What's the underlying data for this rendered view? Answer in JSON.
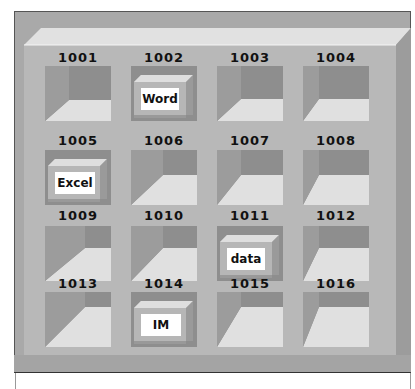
{
  "diagram": {
    "title": "",
    "colors": {
      "frame": "#a9a9a9",
      "face": "#b9b9b9",
      "bevel_top": "#e2e2e2",
      "right_face": "#9a9a9a",
      "cell_back": "#8f8f8f",
      "cell_left": "#9b9b9b",
      "cell_floor": "#e0e0e0",
      "drawer_face": "#b5b5b5",
      "drawer_top": "#dcdcdc",
      "drawer_label_bg": "#ffffff"
    },
    "cells": [
      {
        "id": "1001",
        "drawer": ""
      },
      {
        "id": "1002",
        "drawer": "Word"
      },
      {
        "id": "1003",
        "drawer": ""
      },
      {
        "id": "1004",
        "drawer": ""
      },
      {
        "id": "1005",
        "drawer": "Excel"
      },
      {
        "id": "1006",
        "drawer": ""
      },
      {
        "id": "1007",
        "drawer": ""
      },
      {
        "id": "1008",
        "drawer": ""
      },
      {
        "id": "1009",
        "drawer": ""
      },
      {
        "id": "1010",
        "drawer": ""
      },
      {
        "id": "1011",
        "drawer": "data"
      },
      {
        "id": "1012",
        "drawer": ""
      },
      {
        "id": "1013",
        "drawer": ""
      },
      {
        "id": "1014",
        "drawer": "IM"
      },
      {
        "id": "1015",
        "drawer": ""
      },
      {
        "id": "1016",
        "drawer": ""
      }
    ]
  }
}
